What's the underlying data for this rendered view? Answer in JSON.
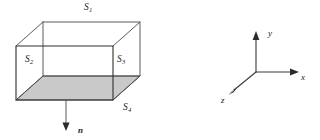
{
  "figure": {
    "background_color": "#ffffff",
    "line_color": "#4a4a4a",
    "shaded_face_color": "#c9c9c9",
    "text_color": "#1a1a1a"
  },
  "box": {
    "description": "Transparent rectangular box drawn in oblique projection with visible hidden edges",
    "shaded_face": "bottom",
    "faces": [
      {
        "id": "S1",
        "letter": "S",
        "subscript": "1",
        "position": "top"
      },
      {
        "id": "S2",
        "letter": "S",
        "subscript": "2",
        "position": "left"
      },
      {
        "id": "S3",
        "letter": "S",
        "subscript": "3",
        "position": "right"
      },
      {
        "id": "S4",
        "letter": "S",
        "subscript": "4",
        "position": "bottom"
      }
    ]
  },
  "normal": {
    "label": "n",
    "direction": "downward",
    "description": "Outward unit normal vector of the shaded bottom face S4"
  },
  "axes": {
    "x": {
      "label": "x",
      "direction": "right"
    },
    "y": {
      "label": "y",
      "direction": "up"
    },
    "z": {
      "label": "z",
      "direction": "lower-left"
    }
  }
}
